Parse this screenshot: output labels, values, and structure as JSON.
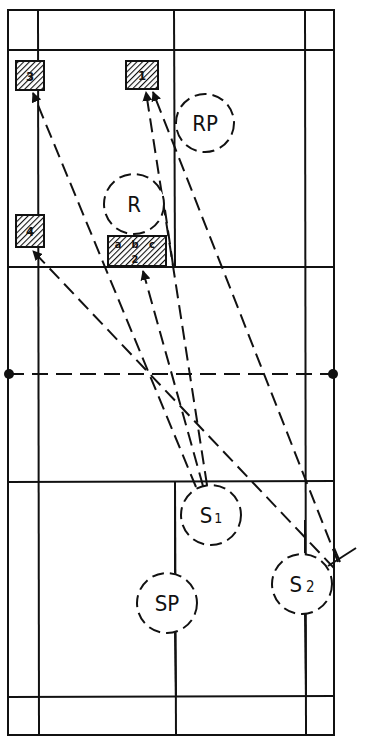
{
  "diagram": {
    "type": "badminton-court-serve-placement",
    "colors": {
      "line": "#111111",
      "background": "#ffffff",
      "hatch": "#111111"
    },
    "court": {
      "outer": {
        "x1": 8,
        "y1": 10,
        "x2": 334,
        "y2": 735
      },
      "side_lines_inner": [
        38,
        305
      ],
      "center_x": 175,
      "back_service_lines": [
        50,
        697
      ],
      "short_service_lines": [
        267,
        482
      ],
      "net": {
        "y": 374,
        "style": "dashed"
      }
    },
    "targets": [
      {
        "id": "t3",
        "label": "3",
        "x": 16,
        "y": 61,
        "w": 28,
        "h": 29
      },
      {
        "id": "t1",
        "label": "1",
        "x": 126,
        "y": 61,
        "w": 32,
        "h": 28
      },
      {
        "id": "t4",
        "label": "4",
        "x": 16,
        "y": 215,
        "w": 28,
        "h": 32
      },
      {
        "id": "t2",
        "label": "2",
        "sublabels": [
          "a",
          "b",
          "c"
        ],
        "x": 108,
        "y": 236,
        "w": 58,
        "h": 30
      }
    ],
    "players": [
      {
        "id": "rp",
        "label": "RP",
        "cx": 205,
        "cy": 123,
        "r": 29
      },
      {
        "id": "r",
        "label": "R",
        "cx": 134,
        "cy": 204,
        "r": 30
      },
      {
        "id": "s1",
        "label": "S",
        "sub": "1",
        "cx": 211,
        "cy": 515,
        "r": 30
      },
      {
        "id": "sp",
        "label": "SP",
        "cx": 167,
        "cy": 603,
        "r": 30
      },
      {
        "id": "s2",
        "label": "S",
        "sub": "2",
        "cx": 304,
        "cy": 584,
        "r": 30
      }
    ],
    "paths": [
      {
        "from": "s1",
        "to": "t3",
        "x1": 196,
        "y1": 487,
        "x2": 33,
        "y2": 92
      },
      {
        "from": "s1",
        "to": "t2",
        "x1": 203,
        "y1": 486,
        "x2": 143,
        "y2": 270
      },
      {
        "from": "s1",
        "to": "t1",
        "x1": 207,
        "y1": 485,
        "x2": 147,
        "y2": 91
      },
      {
        "from": "s2",
        "to": "t4",
        "x1": 336,
        "y1": 568,
        "x2": 33,
        "y2": 250
      },
      {
        "from": "s2",
        "to": "t1",
        "x1": 338,
        "y1": 562,
        "x2": 154,
        "y2": 92
      },
      {
        "from": "s2",
        "to": "t2-c",
        "x1": 175,
        "y1": 267,
        "x2": 168,
        "y2": 220
      }
    ]
  }
}
